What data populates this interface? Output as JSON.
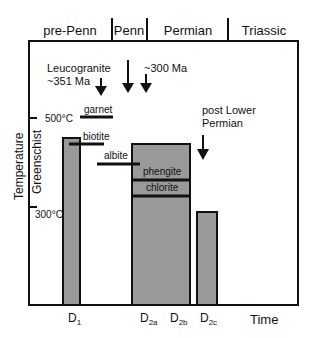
{
  "periods": [
    {
      "label": "pre-Penn",
      "x": 70
    },
    {
      "label": "Penn",
      "x": 129
    },
    {
      "label": "Permian",
      "x": 188
    },
    {
      "label": "Triassic",
      "x": 264
    }
  ],
  "period_dividers_x": [
    112,
    147,
    228
  ],
  "y_axis": {
    "title": "Temperature",
    "facies": "Greenschist",
    "ticks": [
      {
        "label": "500°C",
        "y": 118
      },
      {
        "label": "300°C",
        "y": 207
      }
    ]
  },
  "x_axis": {
    "title": "Time",
    "events": [
      {
        "main": "D",
        "sub": "1",
        "x": 68
      },
      {
        "main": "D",
        "sub": "2a",
        "x": 142
      },
      {
        "main": "D",
        "sub": "2b",
        "x": 172
      },
      {
        "main": "D",
        "sub": "2c",
        "x": 202
      }
    ]
  },
  "annotations": {
    "leucogranite": "Leucogranite",
    "leucogranite_age": "~351 Ma",
    "age_300": "~300 Ma",
    "post_lower_1": "post Lower",
    "post_lower_2": "Permian"
  },
  "deformation_boxes": [
    {
      "name": "D1",
      "x": 63,
      "y": 138,
      "w": 17,
      "h": 167
    },
    {
      "name": "D2a-D2b",
      "x": 132,
      "y": 144,
      "w": 58,
      "h": 161
    },
    {
      "name": "D2c",
      "x": 197,
      "y": 212,
      "w": 20,
      "h": 93
    }
  ],
  "minerals": [
    {
      "label": "garnet",
      "x1": 80,
      "x2": 113,
      "y": 117,
      "lx": 84,
      "ly": 113
    },
    {
      "label": "biotite",
      "x1": 69,
      "x2": 104,
      "y": 144,
      "lx": 83,
      "ly": 140
    },
    {
      "label": "albite",
      "x1": 97,
      "x2": 140,
      "y": 164,
      "lx": 104,
      "ly": 159
    },
    {
      "label": "phengite",
      "x1": 132,
      "x2": 190,
      "y": 180,
      "lx": 143,
      "ly": 175
    },
    {
      "label": "chlorite",
      "x1": 132,
      "x2": 190,
      "y": 196,
      "lx": 146,
      "ly": 191
    }
  ],
  "colors": {
    "fill": "#999999",
    "line": "#111111"
  }
}
